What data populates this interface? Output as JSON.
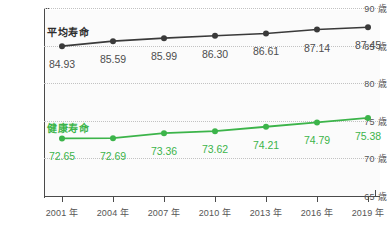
{
  "chart_data": {
    "type": "line",
    "title": "",
    "xlabel": "",
    "ylabel": "",
    "ylim": [
      65,
      90
    ],
    "ytick_step": 5,
    "grid": true,
    "legend": "inline-series-labels",
    "categories": [
      "2001 年",
      "2004 年",
      "2007 年",
      "2010 年",
      "2013 年",
      "2016 年",
      "2019 年"
    ],
    "x": [
      2001,
      2004,
      2007,
      2010,
      2013,
      2016,
      2019
    ],
    "yticks": [
      65,
      70,
      75,
      80,
      85,
      90
    ],
    "ytick_labels": [
      "65 歳",
      "70 歳",
      "75 歳",
      "80 歳",
      "85 歳",
      "90 歳"
    ],
    "series": [
      {
        "name": "平均寿命",
        "color": "#3a3a3a",
        "values": [
          84.93,
          85.59,
          85.99,
          86.3,
          86.61,
          87.14,
          87.45
        ],
        "value_labels": [
          "84.93",
          "85.59",
          "85.99",
          "86.30",
          "86.61",
          "87.14",
          "87.45"
        ]
      },
      {
        "name": "健康寿命",
        "color": "#3cb44a",
        "values": [
          72.65,
          72.69,
          73.36,
          73.62,
          74.21,
          74.79,
          75.38
        ],
        "value_labels": [
          "72.65",
          "72.69",
          "73.36",
          "73.62",
          "74.21",
          "74.79",
          "75.38"
        ]
      }
    ]
  },
  "colors": {
    "average_line": "#3a3a3a",
    "healthy_line": "#3cb44a",
    "axis": "#4a4a4a",
    "gridline": "#c2c2c2",
    "tick_text": "#555555",
    "plot_background": "#fbfbfb"
  }
}
